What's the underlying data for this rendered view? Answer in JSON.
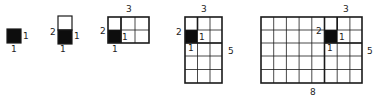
{
  "figures": [
    {
      "id": "fig1",
      "cols": 1,
      "rows": 1,
      "labels": {
        "right": "1",
        "bottom": "1"
      }
    },
    {
      "id": "fig2",
      "cols": 1,
      "rows": 2,
      "labels": {
        "left": "2",
        "right": "1",
        "bottom": "1"
      }
    },
    {
      "id": "fig3",
      "cols": 3,
      "rows": 2,
      "labels": {
        "top": "3",
        "left": "2",
        "inner_right": "1",
        "bottom": "1"
      }
    },
    {
      "id": "fig4",
      "cols": 3,
      "rows": 5,
      "labels": {
        "top": "3",
        "left": "2",
        "inner_right": "1",
        "inner_below": "1",
        "right": "5"
      }
    },
    {
      "id": "fig5",
      "cols": 8,
      "rows": 5,
      "labels": {
        "top": "3",
        "left": "2",
        "inner_right": "1",
        "inner_below": "1",
        "right": "5",
        "bottom": "8"
      }
    }
  ],
  "colors": {
    "line": "#1a1a1a",
    "fill": "#0d0d0d",
    "background": "#ffffff"
  }
}
